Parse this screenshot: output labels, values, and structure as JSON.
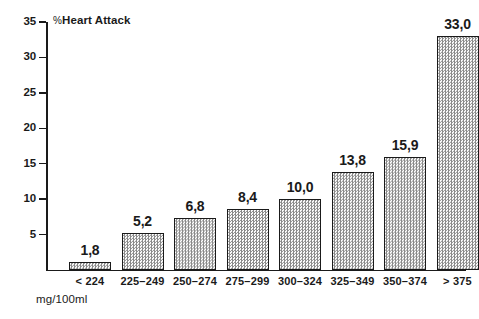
{
  "chart_data": {
    "type": "bar",
    "title": "",
    "subtitle": "",
    "xlabel": "mg/100ml",
    "ylabel": "% Heart Attack",
    "ylim": [
      0,
      35
    ],
    "yticks": [
      5,
      10,
      15,
      20,
      25,
      30,
      35
    ],
    "grid": false,
    "legend": null,
    "decimal_separator": ",",
    "categories": [
      "< 224",
      "225–249",
      "250–274",
      "275–299",
      "300–324",
      "325–349",
      "350–374",
      "> 375"
    ],
    "values": [
      1.8,
      5.2,
      6.8,
      8.4,
      10.0,
      13.8,
      15.9,
      33.0
    ],
    "value_labels": [
      "1,8",
      "5,2",
      "6,8",
      "8,4",
      "10,0",
      "13,8",
      "15,9",
      "33,0"
    ],
    "drawn_heights": [
      1.1,
      5.2,
      7.4,
      8.6,
      10.0,
      13.8,
      15.9,
      33.0
    ],
    "bar_style": {
      "fill": "#d2d2d2",
      "pattern": "checkerboard-dither",
      "border": "#1a1a1a"
    }
  },
  "axes": {
    "y_title_percent": "%",
    "y_title_text": "Heart Attack",
    "y_tick_labels": [
      "35",
      "30",
      "25",
      "20",
      "15",
      "10",
      "5"
    ],
    "x_title": "mg/100ml"
  }
}
